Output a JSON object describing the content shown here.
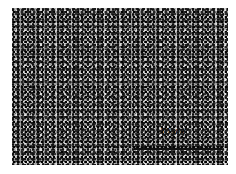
{
  "image": {
    "description": "Grayscale optical micrograph of fine-grained microstructure",
    "scale_bar": {
      "label": "50 μm"
    },
    "colors": {
      "background": "#ffffff",
      "scale_bar": "#111111"
    }
  }
}
